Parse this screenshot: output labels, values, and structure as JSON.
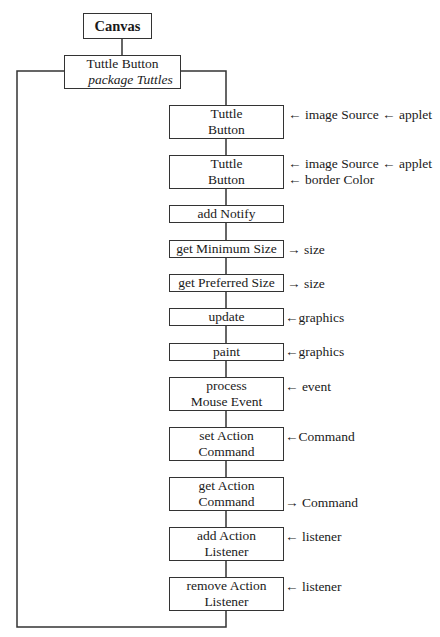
{
  "diagram": {
    "root": {
      "label": "Canvas"
    },
    "class_box": {
      "title": "Tuttle Button",
      "subtitle": "package Tuttles"
    },
    "methods": [
      {
        "line1": "Tuttle",
        "line2": "Button",
        "annotations": [
          "← image Source ← applet"
        ]
      },
      {
        "line1": "Tuttle",
        "line2": "Button",
        "annotations": [
          "← image Source ← applet",
          "← border Color"
        ]
      },
      {
        "line1": "add Notify",
        "line2": "",
        "annotations": []
      },
      {
        "line1": "get Minimum Size",
        "line2": "",
        "annotations": [
          "→ size"
        ]
      },
      {
        "line1": "get Preferred Size",
        "line2": "",
        "annotations": [
          "→ size"
        ]
      },
      {
        "line1": "update",
        "line2": "",
        "annotations": [
          "←graphics"
        ]
      },
      {
        "line1": "paint",
        "line2": "",
        "annotations": [
          "←graphics"
        ]
      },
      {
        "line1": "process",
        "line2": "Mouse Event",
        "annotations": [
          "← event"
        ]
      },
      {
        "line1": "set Action",
        "line2": "Command",
        "annotations": [
          "←Command"
        ]
      },
      {
        "line1": "get Action",
        "line2": "Command",
        "annotations": [
          "→ Command"
        ]
      },
      {
        "line1": "add Action",
        "line2": "Listener",
        "annotations": [
          "← listener"
        ]
      },
      {
        "line1": "remove Action",
        "line2": "Listener",
        "annotations": [
          "← listener"
        ]
      }
    ]
  }
}
